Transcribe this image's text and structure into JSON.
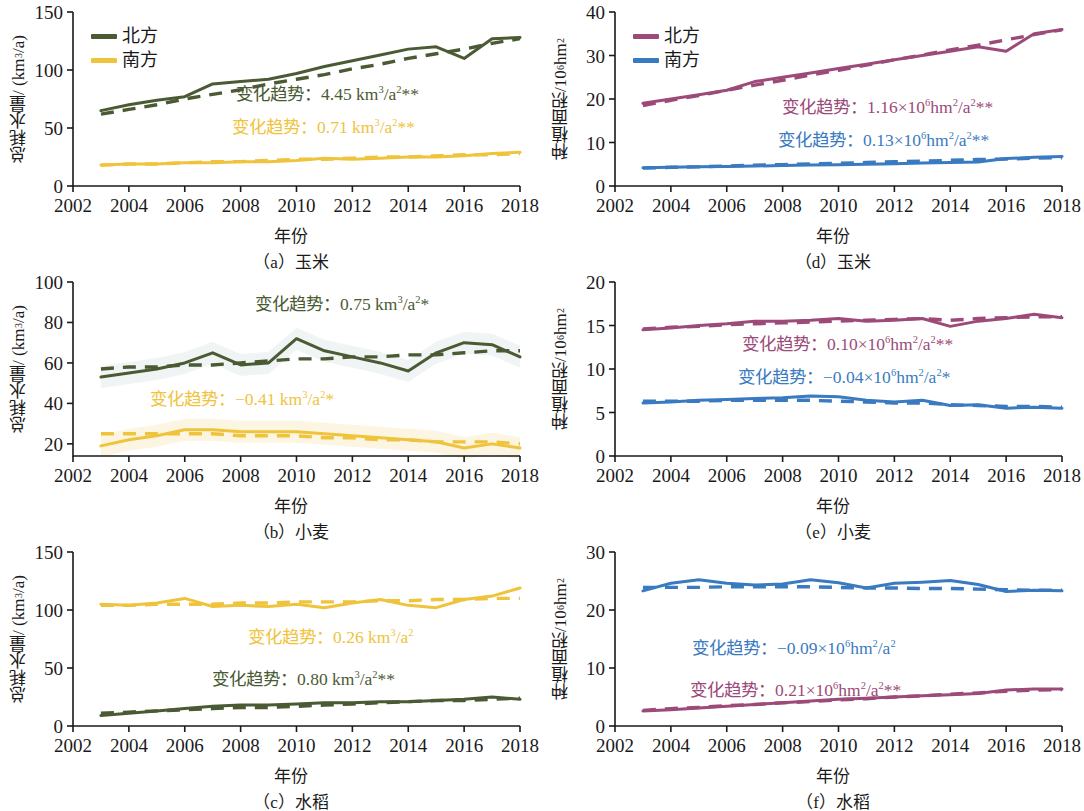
{
  "figure": {
    "colors": {
      "north_green": "#4a5a33",
      "south_yellow": "#f0c33c",
      "north_purple": "#9c4a79",
      "south_blue": "#3a7ac0",
      "axis": "#1a1a1a",
      "band_green": "#e9eef0",
      "band_yellow": "#faf0d2"
    },
    "xlabel": "年份",
    "legend": {
      "north": "北方",
      "south": "南方"
    },
    "ylabel_water": "总耗水量/ (km3/a)",
    "ylabel_area": "种植面积/106hm2",
    "xticks": [
      "2002",
      "2004",
      "2006",
      "2008",
      "2010",
      "2012",
      "2014",
      "2016",
      "2018"
    ]
  },
  "panels": [
    {
      "id": "a",
      "caption": "（a）玉米",
      "crop": "玉米",
      "metric": "water",
      "ylabel_main": "总耗水量/ (km",
      "ylabel_sup": "3",
      "ylabel_tail": "/a)",
      "yticks": [
        "0",
        "50",
        "100",
        "150"
      ],
      "legend": true,
      "annotations": [
        {
          "prefix": "变化趋势：4.45 km",
          "sup": "3",
          "mid": "/a",
          "sup2": "2",
          "stars": "**",
          "color": "#4a5a33"
        },
        {
          "prefix": "变化趋势：0.71 km",
          "sup": "3",
          "mid": "/a",
          "sup2": "2",
          "stars": "**",
          "color": "#f0c33c"
        }
      ]
    },
    {
      "id": "b",
      "caption": "（b）小麦",
      "crop": "小麦",
      "metric": "water",
      "ylabel_main": "总耗水量/ (km",
      "ylabel_sup": "3",
      "ylabel_tail": "/a)",
      "yticks": [
        "20",
        "40",
        "60",
        "80",
        "100"
      ],
      "legend": false,
      "annotations": [
        {
          "prefix": "变化趋势：0.75 km",
          "sup": "3",
          "mid": "/a",
          "sup2": "2",
          "stars": "*",
          "color": "#4a5a33"
        },
        {
          "prefix": "变化趋势：−0.41 km",
          "sup": "3",
          "mid": "/a",
          "sup2": "2",
          "stars": "*",
          "color": "#f0c33c"
        }
      ]
    },
    {
      "id": "c",
      "caption": "（c）水稻",
      "crop": "水稻",
      "metric": "water",
      "ylabel_main": "总耗水量/ (km",
      "ylabel_sup": "3",
      "ylabel_tail": "/a)",
      "yticks": [
        "0",
        "50",
        "100",
        "150"
      ],
      "legend": false,
      "annotations": [
        {
          "prefix": "变化趋势：0.26 km",
          "sup": "3",
          "mid": "/a",
          "sup2": "2",
          "stars": "",
          "color": "#f0c33c"
        },
        {
          "prefix": "变化趋势：0.80 km",
          "sup": "3",
          "mid": "/a",
          "sup2": "2",
          "stars": "**",
          "color": "#4a5a33"
        }
      ]
    },
    {
      "id": "d",
      "caption": "（d）玉米",
      "crop": "玉米",
      "metric": "area",
      "ylabel_main": "种植面积/10",
      "ylabel_sup": "6",
      "ylabel_tail": "hm2",
      "yticks": [
        "0",
        "10",
        "20",
        "30",
        "40"
      ],
      "legend": true,
      "annotations": [
        {
          "prefix": "变化趋势：1.16×10",
          "sup": "6",
          "mid": "hm",
          "sup2": "2",
          "mid2": "/a",
          "sup3": "2",
          "stars": "**",
          "color": "#9c4a79"
        },
        {
          "prefix": "变化趋势：0.13×10",
          "sup": "6",
          "mid": "hm",
          "sup2": "2",
          "mid2": "/a",
          "sup3": "2",
          "stars": "**",
          "color": "#3a7ac0"
        }
      ]
    },
    {
      "id": "e",
      "caption": "（e）小麦",
      "crop": "小麦",
      "metric": "area",
      "ylabel_main": "种植面积/10",
      "ylabel_sup": "6",
      "ylabel_tail": "hm2",
      "yticks": [
        "0",
        "5",
        "10",
        "15",
        "20"
      ],
      "legend": false,
      "annotations": [
        {
          "prefix": "变化趋势：0.10×10",
          "sup": "6",
          "mid": "hm",
          "sup2": "2",
          "mid2": "/a",
          "sup3": "2",
          "stars": "**",
          "color": "#9c4a79"
        },
        {
          "prefix": "变化趋势：−0.04×10",
          "sup": "6",
          "mid": "hm",
          "sup2": "2",
          "mid2": "/a",
          "sup3": "2",
          "stars": "*",
          "color": "#3a7ac0"
        }
      ]
    },
    {
      "id": "f",
      "caption": "（f）水稻",
      "crop": "水稻",
      "metric": "area",
      "ylabel_main": "种植面积/10",
      "ylabel_sup": "6",
      "ylabel_tail": "hm2",
      "yticks": [
        "0",
        "10",
        "20",
        "30"
      ],
      "legend": false,
      "annotations": [
        {
          "prefix": "变化趋势：−0.09×10",
          "sup": "6",
          "mid": "hm",
          "sup2": "2",
          "mid2": "/a",
          "sup3": "2",
          "stars": "",
          "color": "#3a7ac0"
        },
        {
          "prefix": "变化趋势：0.21×10",
          "sup": "6",
          "mid": "hm",
          "sup2": "2",
          "mid2": "/a",
          "sup3": "2",
          "stars": "**",
          "color": "#9c4a79"
        }
      ]
    }
  ],
  "chart_data": [
    {
      "panel": "a",
      "type": "line",
      "title": "（a）玉米",
      "xlabel": "年份",
      "ylabel": "总耗水量/ (km3/a)",
      "xlim": [
        2002,
        2018
      ],
      "ylim": [
        0,
        150
      ],
      "yticks": [
        0,
        50,
        100,
        150
      ],
      "grid": false,
      "legend_position": "top-left",
      "x": [
        2003,
        2004,
        2005,
        2006,
        2007,
        2008,
        2009,
        2010,
        2011,
        2012,
        2013,
        2014,
        2015,
        2016,
        2017,
        2018
      ],
      "series": [
        {
          "name": "北方",
          "color": "#4a5a33",
          "values": [
            65,
            70,
            74,
            77,
            88,
            90,
            92,
            97,
            103,
            108,
            113,
            118,
            120,
            110,
            127,
            128
          ],
          "trend_dashed": [
            62,
            66,
            70,
            75,
            79,
            83,
            88,
            92,
            96,
            101,
            105,
            110,
            114,
            118,
            123,
            127
          ]
        },
        {
          "name": "南方",
          "color": "#f0c33c",
          "values": [
            18,
            19,
            19,
            20,
            20,
            21,
            21,
            22,
            24,
            23,
            24,
            25,
            25,
            26,
            28,
            29
          ],
          "trend_dashed": [
            18,
            19,
            19,
            20,
            21,
            21,
            22,
            23,
            23,
            24,
            25,
            25,
            26,
            27,
            27,
            28
          ]
        }
      ]
    },
    {
      "panel": "b",
      "type": "line",
      "title": "（b）小麦",
      "xlabel": "年份",
      "ylabel": "总耗水量/ (km3/a)",
      "xlim": [
        2002,
        2018
      ],
      "ylim": [
        14,
        100
      ],
      "yticks": [
        20,
        40,
        60,
        80,
        100
      ],
      "grid": false,
      "legend_position": "none",
      "x": [
        2003,
        2004,
        2005,
        2006,
        2007,
        2008,
        2009,
        2010,
        2011,
        2012,
        2013,
        2014,
        2015,
        2016,
        2017,
        2018
      ],
      "series": [
        {
          "name": "北方",
          "color": "#4a5a33",
          "values": [
            53,
            55,
            57,
            60,
            65,
            59,
            60,
            72,
            66,
            63,
            60,
            56,
            65,
            70,
            69,
            63
          ],
          "trend_dashed": [
            57,
            58,
            58,
            59,
            59,
            60,
            61,
            62,
            62,
            63,
            63,
            64,
            64,
            65,
            66,
            66
          ],
          "band": true
        },
        {
          "name": "南方",
          "color": "#f0c33c",
          "values": [
            19,
            22,
            24,
            27,
            27,
            26,
            26,
            26,
            25,
            24,
            23,
            22,
            21,
            18,
            20,
            18
          ],
          "trend_dashed": [
            25,
            25,
            25,
            25,
            25,
            24,
            24,
            24,
            23,
            23,
            22,
            22,
            21,
            21,
            21,
            20
          ],
          "band": true
        }
      ]
    },
    {
      "panel": "c",
      "type": "line",
      "title": "（c）水稻",
      "xlabel": "年份",
      "ylabel": "总耗水量/ (km3/a)",
      "xlim": [
        2002,
        2018
      ],
      "ylim": [
        0,
        150
      ],
      "yticks": [
        0,
        50,
        100,
        150
      ],
      "grid": false,
      "legend_position": "none",
      "x": [
        2003,
        2004,
        2005,
        2006,
        2007,
        2008,
        2009,
        2010,
        2011,
        2012,
        2013,
        2014,
        2015,
        2016,
        2017,
        2018
      ],
      "series": [
        {
          "name": "南方",
          "color": "#f0c33c",
          "values": [
            105,
            104,
            106,
            110,
            103,
            104,
            103,
            105,
            102,
            106,
            109,
            104,
            102,
            109,
            112,
            119
          ],
          "trend_dashed": [
            104,
            104,
            105,
            105,
            105,
            106,
            106,
            107,
            107,
            107,
            108,
            108,
            109,
            109,
            110,
            110
          ]
        },
        {
          "name": "北方",
          "color": "#4a5a33",
          "values": [
            9,
            11,
            13,
            15,
            17,
            18,
            18,
            19,
            20,
            20,
            21,
            21,
            22,
            23,
            25,
            23
          ],
          "trend_dashed": [
            11,
            12,
            13,
            14,
            15,
            16,
            16,
            17,
            18,
            19,
            20,
            21,
            22,
            22,
            23,
            24
          ]
        }
      ]
    },
    {
      "panel": "d",
      "type": "line",
      "title": "（d）玉米",
      "xlabel": "年份",
      "ylabel": "种植面积/106hm2",
      "xlim": [
        2002,
        2018
      ],
      "ylim": [
        0,
        40
      ],
      "yticks": [
        0,
        10,
        20,
        30,
        40
      ],
      "grid": false,
      "legend_position": "top-left",
      "x": [
        2003,
        2004,
        2005,
        2006,
        2007,
        2008,
        2009,
        2010,
        2011,
        2012,
        2013,
        2014,
        2015,
        2016,
        2017,
        2018
      ],
      "series": [
        {
          "name": "北方",
          "color": "#9c4a79",
          "values": [
            19,
            20,
            21,
            22,
            24,
            25,
            26,
            27,
            28,
            29,
            30,
            31,
            32,
            31,
            35,
            36
          ],
          "trend_dashed": [
            18.5,
            19.7,
            20.8,
            22.0,
            23.2,
            24.3,
            25.5,
            26.6,
            27.8,
            29.0,
            30.1,
            31.3,
            32.4,
            33.6,
            34.8,
            35.9
          ]
        },
        {
          "name": "南方",
          "color": "#3a7ac0",
          "values": [
            4.2,
            4.3,
            4.4,
            4.5,
            4.6,
            4.7,
            4.8,
            4.9,
            5.0,
            5.1,
            5.3,
            5.4,
            5.5,
            6.3,
            6.6,
            6.8
          ],
          "trend_dashed": [
            4.1,
            4.3,
            4.4,
            4.6,
            4.8,
            4.9,
            5.1,
            5.2,
            5.4,
            5.6,
            5.7,
            5.9,
            6.1,
            6.2,
            6.4,
            6.5
          ]
        }
      ]
    },
    {
      "panel": "e",
      "type": "line",
      "title": "（e）小麦",
      "xlabel": "年份",
      "ylabel": "种植面积/106hm2",
      "xlim": [
        2002,
        2018
      ],
      "ylim": [
        0,
        20
      ],
      "yticks": [
        0,
        5,
        10,
        15,
        20
      ],
      "grid": false,
      "legend_position": "none",
      "x": [
        2003,
        2004,
        2005,
        2006,
        2007,
        2008,
        2009,
        2010,
        2011,
        2012,
        2013,
        2014,
        2015,
        2016,
        2017,
        2018
      ],
      "series": [
        {
          "name": "北方",
          "color": "#9c4a79",
          "values": [
            14.5,
            14.7,
            15.0,
            15.2,
            15.5,
            15.5,
            15.6,
            15.8,
            15.5,
            15.6,
            15.8,
            14.9,
            15.5,
            15.8,
            16.3,
            15.9
          ],
          "trend_dashed": [
            14.6,
            14.8,
            14.9,
            15.1,
            15.2,
            15.3,
            15.4,
            15.5,
            15.6,
            15.7,
            15.8,
            15.6,
            15.8,
            15.9,
            16.0,
            16.0
          ]
        },
        {
          "name": "南方",
          "color": "#3a7ac0",
          "values": [
            6.1,
            6.2,
            6.4,
            6.5,
            6.6,
            6.7,
            6.9,
            6.8,
            6.4,
            6.2,
            6.4,
            5.8,
            5.9,
            5.5,
            5.6,
            5.5
          ],
          "trend_dashed": [
            6.3,
            6.3,
            6.3,
            6.4,
            6.4,
            6.4,
            6.4,
            6.3,
            6.2,
            6.1,
            6.1,
            5.9,
            5.8,
            5.7,
            5.7,
            5.6
          ]
        }
      ]
    },
    {
      "panel": "f",
      "type": "line",
      "title": "（f）水稻",
      "xlabel": "年份",
      "ylabel": "种植面积/106hm2",
      "xlim": [
        2002,
        2018
      ],
      "ylim": [
        0,
        30
      ],
      "yticks": [
        0,
        10,
        20,
        30
      ],
      "grid": false,
      "legend_position": "none",
      "x": [
        2003,
        2004,
        2005,
        2006,
        2007,
        2008,
        2009,
        2010,
        2011,
        2012,
        2013,
        2014,
        2015,
        2016,
        2017,
        2018
      ],
      "series": [
        {
          "name": "南方",
          "color": "#3a7ac0",
          "values": [
            23.3,
            24.6,
            25.2,
            24.6,
            24.3,
            24.5,
            25.2,
            24.7,
            23.8,
            24.6,
            24.8,
            25.1,
            24.4,
            23.2,
            23.4,
            23.3
          ],
          "trend_dashed": [
            23.9,
            23.9,
            23.9,
            24.0,
            24.0,
            24.0,
            24.0,
            23.9,
            23.8,
            23.8,
            23.7,
            23.7,
            23.6,
            23.5,
            23.4,
            23.4
          ]
        },
        {
          "name": "北方",
          "color": "#9c4a79",
          "values": [
            2.6,
            2.8,
            3.1,
            3.4,
            3.7,
            4.0,
            4.3,
            4.6,
            4.8,
            5.0,
            5.2,
            5.4,
            5.6,
            6.2,
            6.4,
            6.4
          ],
          "trend_dashed": [
            2.7,
            3.0,
            3.2,
            3.5,
            3.7,
            4.0,
            4.2,
            4.5,
            4.7,
            5.0,
            5.2,
            5.5,
            5.7,
            6.0,
            6.2,
            6.3
          ]
        }
      ]
    }
  ]
}
